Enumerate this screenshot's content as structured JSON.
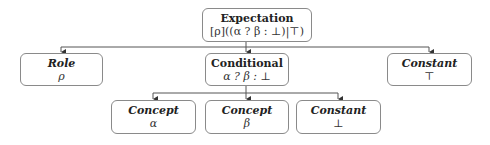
{
  "diagram": {
    "root": {
      "title": "Expectation",
      "expr": "[ρ]((α ? β : ⊥)|⊤)"
    },
    "level1": [
      {
        "title": "Role",
        "expr": "ρ"
      },
      {
        "title": "Conditional",
        "expr": "α ? β : ⊥"
      },
      {
        "title": "Constant",
        "expr": "⊤"
      }
    ],
    "level2": [
      {
        "title": "Concept",
        "expr": "α"
      },
      {
        "title": "Concept",
        "expr": "β"
      },
      {
        "title": "Constant",
        "expr": "⊥"
      }
    ]
  }
}
